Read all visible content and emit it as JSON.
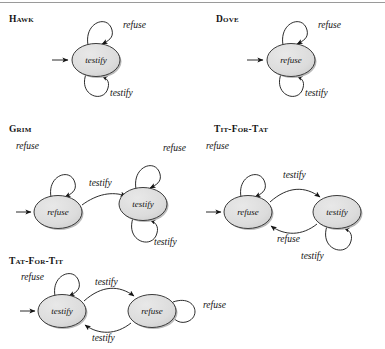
{
  "page": {
    "background_color": "#ffffff",
    "node_fill": "#dcdcdc",
    "node_stroke": "#3a3a3a",
    "edge_color": "#1a1a1a",
    "shadow_color": "#b4b4b4"
  },
  "diagrams": [
    {
      "id": "hawk",
      "caption": "Hawk",
      "states": [
        {
          "id": "hawk-s0",
          "label": "testify",
          "start": true
        }
      ],
      "edges": [
        {
          "from": "hawk-s0",
          "to": "hawk-s0",
          "label": "refuse",
          "kind": "self-loop-top"
        },
        {
          "from": "hawk-s0",
          "to": "hawk-s0",
          "label": "testify",
          "kind": "self-loop-bottom"
        }
      ]
    },
    {
      "id": "dove",
      "caption": "Dove",
      "states": [
        {
          "id": "dove-s0",
          "label": "refuse",
          "start": true
        }
      ],
      "edges": [
        {
          "from": "dove-s0",
          "to": "dove-s0",
          "label": "refuse",
          "kind": "self-loop-top"
        },
        {
          "from": "dove-s0",
          "to": "dove-s0",
          "label": "testify",
          "kind": "self-loop-bottom"
        }
      ]
    },
    {
      "id": "grim",
      "caption": "Grim",
      "states": [
        {
          "id": "grim-s0",
          "label": "refuse",
          "start": true
        },
        {
          "id": "grim-s1",
          "label": "testify",
          "start": false
        }
      ],
      "edges": [
        {
          "from": "grim-s0",
          "to": "grim-s0",
          "label": "refuse",
          "kind": "self-loop-top"
        },
        {
          "from": "grim-s0",
          "to": "grim-s1",
          "label": "testify",
          "kind": "transition"
        },
        {
          "from": "grim-s1",
          "to": "grim-s1",
          "label": "refuse",
          "kind": "self-loop-top"
        },
        {
          "from": "grim-s1",
          "to": "grim-s1",
          "label": "testify",
          "kind": "self-loop-bottom"
        }
      ]
    },
    {
      "id": "tit-for-tat",
      "caption": "Tit-For-Tat",
      "states": [
        {
          "id": "tft-s0",
          "label": "refuse",
          "start": true
        },
        {
          "id": "tft-s1",
          "label": "testify",
          "start": false
        }
      ],
      "edges": [
        {
          "from": "tft-s0",
          "to": "tft-s0",
          "label": "refuse",
          "kind": "self-loop-top"
        },
        {
          "from": "tft-s0",
          "to": "tft-s1",
          "label": "testify",
          "kind": "transition-upper"
        },
        {
          "from": "tft-s1",
          "to": "tft-s0",
          "label": "refuse",
          "kind": "transition-lower"
        },
        {
          "from": "tft-s1",
          "to": "tft-s1",
          "label": "testify",
          "kind": "self-loop-bottom"
        }
      ]
    },
    {
      "id": "tat-for-tit",
      "caption": "Tat-For-Tit",
      "states": [
        {
          "id": "tfti-s0",
          "label": "testify",
          "start": true
        },
        {
          "id": "tfti-s1",
          "label": "refuse",
          "start": false
        }
      ],
      "edges": [
        {
          "from": "tfti-s0",
          "to": "tfti-s0",
          "label": "refuse",
          "kind": "self-loop-top"
        },
        {
          "from": "tfti-s0",
          "to": "tfti-s1",
          "label": "testify",
          "kind": "transition-upper"
        },
        {
          "from": "tfti-s1",
          "to": "tfti-s0",
          "label": "testify",
          "kind": "transition-lower"
        },
        {
          "from": "tfti-s1",
          "to": "tfti-s1",
          "label": "refuse",
          "kind": "self-loop-right"
        }
      ]
    }
  ],
  "labels": {
    "hawk_loop_top": "refuse",
    "hawk_loop_bottom": "testify",
    "hawk_state": "testify",
    "dove_loop_top": "refuse",
    "dove_loop_bottom": "testify",
    "dove_state": "refuse",
    "grim_s0_state": "refuse",
    "grim_s1_state": "testify",
    "grim_s0_loop": "refuse",
    "grim_trans": "testify",
    "grim_s1_loop_top": "refuse",
    "grim_s1_loop_bottom": "testify",
    "tft_s0_state": "refuse",
    "tft_s1_state": "testify",
    "tft_s0_loop": "refuse",
    "tft_trans_upper": "testify",
    "tft_trans_lower": "refuse",
    "tft_s1_loop": "testify",
    "tfti_s0_state": "testify",
    "tfti_s1_state": "refuse",
    "tfti_s0_loop": "refuse",
    "tfti_trans_upper": "testify",
    "tfti_trans_lower": "testify",
    "tfti_s1_loop": "refuse"
  }
}
